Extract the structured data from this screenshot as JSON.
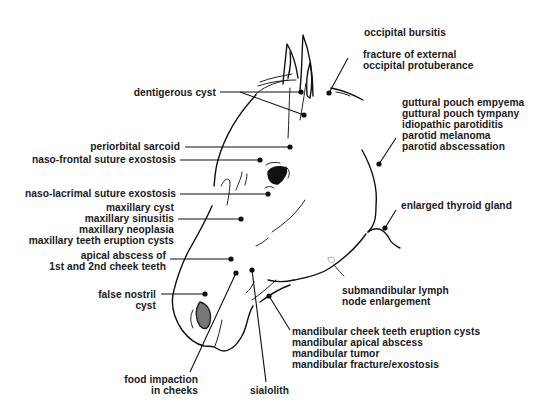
{
  "diagram": {
    "labels": {
      "occipital_bursitis": [
        "occipital bursitis"
      ],
      "fracture_occipital": [
        "fracture of external",
        "occipital protuberance"
      ],
      "dentigerous_cyst": [
        "dentigerous cyst"
      ],
      "guttural_parotid": [
        "guttural pouch empyema",
        "guttural pouch tympany",
        "idiopathic parotiditis",
        "parotid melanoma",
        "parotid abscessation"
      ],
      "periorbital_sarcoid": [
        "periorbital sarcoid"
      ],
      "naso_frontal": [
        "naso-frontal suture exostosis"
      ],
      "naso_lacrimal": [
        "naso-lacrimal suture exostosis"
      ],
      "enlarged_thyroid": [
        "enlarged thyroid gland"
      ],
      "maxillary": [
        "maxillary cyst",
        "maxillary sinusitis",
        "maxillary neoplasia",
        "maxillary teeth eruption cysts"
      ],
      "apical_abscess": [
        "apical abscess of",
        "1st and 2nd cheek teeth"
      ],
      "submandibular": [
        "submandibular lymph",
        "node enlargement"
      ],
      "false_nostril": [
        "false nostril",
        "cyst"
      ],
      "mandibular": [
        "mandibular cheek teeth eruption cysts",
        "mandibular apical abscess",
        "mandibular tumor",
        "mandibular fracture/exostosis"
      ],
      "food_impaction": [
        "food impaction",
        "in cheeks"
      ],
      "sialolith": [
        "sialolith"
      ]
    },
    "colors": {
      "ink": "#111111",
      "background": "#ffffff"
    }
  }
}
